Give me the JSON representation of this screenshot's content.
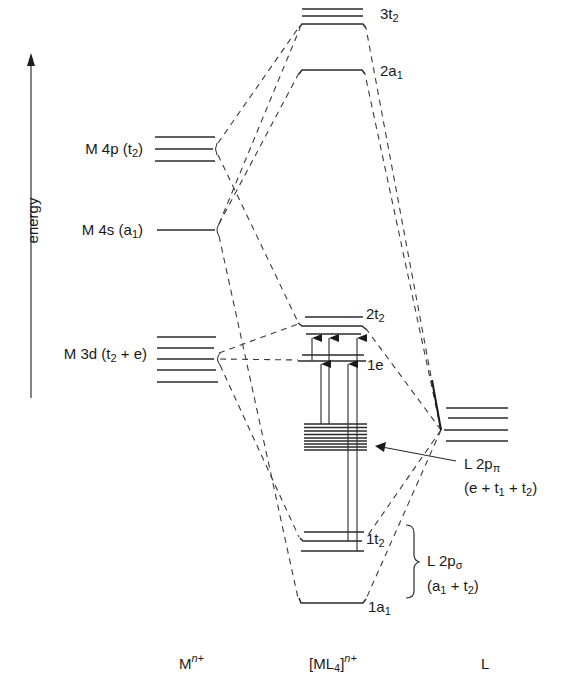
{
  "diagram": {
    "type": "molecular-orbital-energy-level-diagram",
    "axis_label": "energy",
    "columns": {
      "metal": {
        "label_main": "M",
        "label_sup": "n+"
      },
      "complex": {
        "label_main": "[ML",
        "label_sub": "4",
        "label_close": "]",
        "label_sup": "n+"
      },
      "ligand": {
        "label_main": "L"
      }
    },
    "metal_orbitals": [
      {
        "id": "m4p",
        "label_pre": "M 4p (t",
        "label_sub": "2",
        "label_post": ")",
        "levels": 3
      },
      {
        "id": "m4s",
        "label_pre": "M 4s (a",
        "label_sub": "1",
        "label_post": ")",
        "levels": 1
      },
      {
        "id": "m3d",
        "label_pre": "M 3d (t",
        "label_sub": "2",
        "label_post": " + e)",
        "levels": 5
      }
    ],
    "complex_orbitals": [
      {
        "id": "3t2",
        "label_pre": "3t",
        "label_sub": "2",
        "levels": 3
      },
      {
        "id": "2a1",
        "label_pre": "2a",
        "label_sub": "1",
        "levels": 1
      },
      {
        "id": "2t2",
        "label_pre": "2t",
        "label_sub": "2",
        "levels": 3
      },
      {
        "id": "1e",
        "label_pre": "1e",
        "label_sub": "",
        "levels": 2
      },
      {
        "id": "L2ppi_block",
        "label_pre": "",
        "label_sub": "",
        "levels": 9
      },
      {
        "id": "1t2",
        "label_pre": "1t",
        "label_sub": "2",
        "levels": 3
      },
      {
        "id": "1a1",
        "label_pre": "1a",
        "label_sub": "1",
        "levels": 1
      }
    ],
    "ligand_orbitals": {
      "levels": 4
    },
    "annotations": {
      "pi": {
        "line1_pre": "L 2p",
        "line1_sub": "π",
        "line2_a": "(e + t",
        "line2_sub1": "1",
        "line2_b": " + t",
        "line2_sub2": "2",
        "line2_c": ")"
      },
      "sigma": {
        "line1_pre": "L 2p",
        "line1_sub": "σ",
        "line2_a": "(a",
        "line2_sub1": "1",
        "line2_b": " + t",
        "line2_sub2": "2",
        "line2_c": ")"
      }
    },
    "transitions": 5,
    "colors": {
      "line": "#2a2a2a",
      "background": "#ffffff"
    }
  }
}
